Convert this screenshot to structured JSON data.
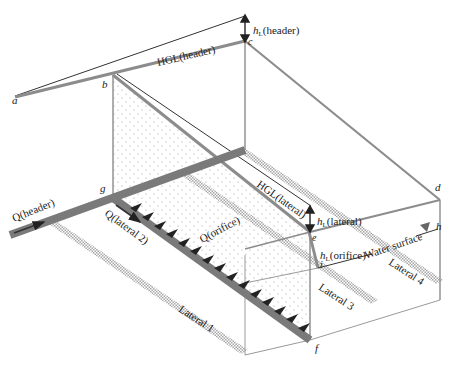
{
  "diagram": {
    "colors": {
      "pipe": "#7a7a7a",
      "line": "#8c8c8c",
      "thin": "#333333",
      "hatch": "#b5b5b5",
      "dots": "#9a9a9a"
    },
    "points": {
      "a": "a",
      "b": "b",
      "c": "c",
      "d": "d",
      "e": "e",
      "f": "f",
      "g": "g",
      "h": "h",
      "i": "i"
    },
    "labels": {
      "hgl_header": "HGL(header)",
      "hl_header_h": "h",
      "hl_header_sub": "L",
      "hl_header_rest": "(header)",
      "hgl_lateral": "HGL(lateral)",
      "hl_lateral_h": "h",
      "hl_lateral_sub": "L",
      "hl_lateral_rest": "(lateral)",
      "hl_orifice_h": "h",
      "hl_orifice_sub": "L",
      "hl_orifice_rest": "(orifice)",
      "water_surface": "Water surface",
      "q_header": "Q(header)",
      "q_lateral2": "Q(lateral 2)",
      "q_orifice": "Q(orifice)",
      "lateral1": "Lateral 1",
      "lateral3": "Lateral 3",
      "lateral4": "Lateral 4"
    }
  }
}
